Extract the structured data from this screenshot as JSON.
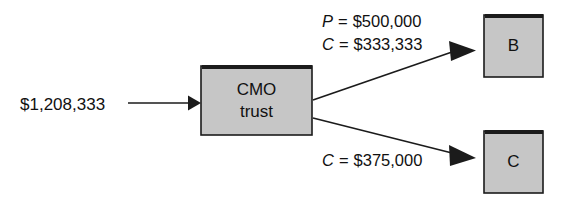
{
  "diagram": {
    "type": "flow",
    "background_color": "#ffffff",
    "box_fill_color": "#c6c6c6",
    "box_border_color": "#1b1b1b",
    "line_color": "#1b1b1b",
    "input": {
      "amount": "$1,208,333"
    },
    "trust": {
      "line1": "CMO",
      "line2": "trust"
    },
    "tranche_b": {
      "label": "B",
      "principal_symbol": "P",
      "principal_eq": "=",
      "principal_value": "$500,000",
      "coupon_symbol": "C",
      "coupon_eq": "=",
      "coupon_value": "$333,333"
    },
    "tranche_c": {
      "label": "C",
      "coupon_symbol": "C",
      "coupon_eq": "=",
      "coupon_value": "$375,000"
    }
  }
}
